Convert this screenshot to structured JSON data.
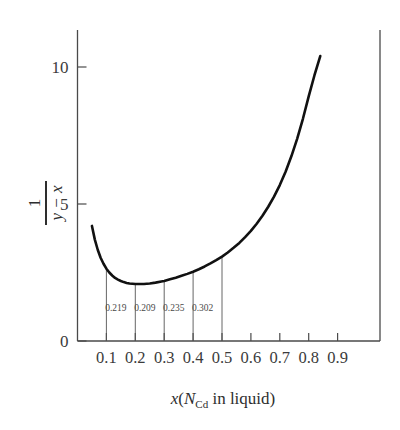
{
  "chart_data": {
    "type": "line",
    "title": "",
    "xlabel": "x(N_Cd in liquid)",
    "xlabel_parts": {
      "var": "x",
      "open": "(",
      "n": "N",
      "sub": "Cd",
      "rest": " in liquid",
      "close": ")"
    },
    "ylabel": "1 / (y - x)",
    "ylabel_parts": {
      "numerator": "1",
      "denominator": "y − x"
    },
    "xlim": [
      0.0,
      0.95
    ],
    "ylim": [
      0,
      11.2
    ],
    "xticks": [
      0.1,
      0.2,
      0.3,
      0.4,
      0.5,
      0.6,
      0.7,
      0.8,
      0.9
    ],
    "xtick_labels": [
      "0.1",
      "0.2",
      "0.3",
      "0.4",
      "0.5",
      "0.6",
      "0.7",
      "0.8",
      "0.9"
    ],
    "yticks": [
      0,
      5,
      10
    ],
    "ytick_labels": [
      "0",
      "5",
      "10"
    ],
    "grid": false,
    "legend": null,
    "series": [
      {
        "name": "1/(y-x)",
        "x": [
          0.05,
          0.06,
          0.07,
          0.08,
          0.09,
          0.1,
          0.11,
          0.12,
          0.13,
          0.14,
          0.15,
          0.16,
          0.17,
          0.18,
          0.19,
          0.2,
          0.21,
          0.22,
          0.23,
          0.24,
          0.25,
          0.27,
          0.29,
          0.3,
          0.32,
          0.34,
          0.36,
          0.38,
          0.4,
          0.42,
          0.44,
          0.46,
          0.48,
          0.5,
          0.52,
          0.54,
          0.56,
          0.58,
          0.6,
          0.62,
          0.64,
          0.66,
          0.68,
          0.7,
          0.72,
          0.74,
          0.76,
          0.78,
          0.8,
          0.82,
          0.84
        ],
        "y": [
          4.2,
          3.7,
          3.33,
          3.04,
          2.82,
          2.64,
          2.5,
          2.39,
          2.3,
          2.24,
          2.19,
          2.15,
          2.12,
          2.1,
          2.09,
          2.08,
          2.08,
          2.08,
          2.08,
          2.09,
          2.1,
          2.13,
          2.17,
          2.19,
          2.25,
          2.31,
          2.38,
          2.45,
          2.53,
          2.62,
          2.72,
          2.83,
          2.95,
          3.08,
          3.23,
          3.4,
          3.58,
          3.79,
          4.02,
          4.28,
          4.57,
          4.9,
          5.27,
          5.69,
          6.18,
          6.74,
          7.38,
          8.11,
          8.93,
          9.7,
          10.4
        ]
      }
    ],
    "annotations": [
      {
        "x": 0.1,
        "label": "0.219",
        "label_x": 0.133,
        "line_top_y": 2.64
      },
      {
        "x": 0.2,
        "label": "0.209",
        "label_x": 0.233,
        "line_top_y": 2.08
      },
      {
        "x": 0.3,
        "label": "0.235",
        "label_x": 0.333,
        "line_top_y": 2.19
      },
      {
        "x": 0.4,
        "label": "0.302",
        "label_x": 0.433,
        "line_top_y": 2.53
      },
      {
        "x": 0.5,
        "label": "",
        "label_x": 0.5,
        "line_top_y": 3.08
      }
    ],
    "annotation_values": [
      "0.219",
      "0.209",
      "0.235",
      "0.302"
    ],
    "annotation_label_y": 1.1,
    "colors": {
      "curve": "#111111",
      "axis": "#4a4a4a",
      "drop_line": "#555555",
      "text": "#3b3b3b",
      "background": "#ffffff"
    }
  }
}
